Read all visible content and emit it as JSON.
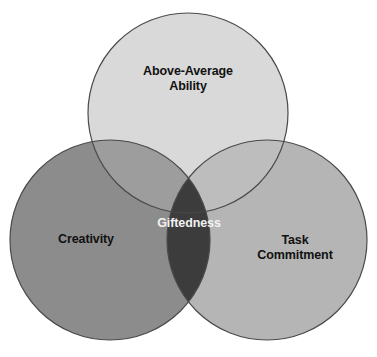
{
  "diagram": {
    "type": "venn",
    "background_color": "#ffffff",
    "outline_color": "#4a4a4a",
    "sets": [
      {
        "id": "ability",
        "label": "Above-Average\nAbility",
        "position": "top",
        "fill_color": "#d9d9d9",
        "text_color": "#111111",
        "cx": 188,
        "cy": 113,
        "r": 100
      },
      {
        "id": "creativity",
        "label": "Creativity",
        "position": "bottom-left",
        "fill_color": "#8c8c8c",
        "text_color": "#111111",
        "cx": 110,
        "cy": 240,
        "r": 100
      },
      {
        "id": "task-commitment",
        "label": "Task\nCommitment",
        "position": "bottom-right",
        "fill_color": "#b5b5b5",
        "text_color": "#111111",
        "cx": 267,
        "cy": 240,
        "r": 100
      }
    ],
    "intersections": [
      {
        "id": "ability-creativity",
        "label": "",
        "fill_color": "#9d9d9d"
      },
      {
        "id": "ability-task",
        "label": "",
        "fill_color": "#bdbdbd"
      },
      {
        "id": "creativity-task",
        "label": "Giftedness",
        "fill_color": "#3c3c3c",
        "text_color": "#f2f2f2"
      }
    ],
    "center": {
      "id": "giftedness",
      "label": "Giftedness",
      "fill_color": "#3c3c3c",
      "text_color": "#f2f2f2"
    }
  }
}
